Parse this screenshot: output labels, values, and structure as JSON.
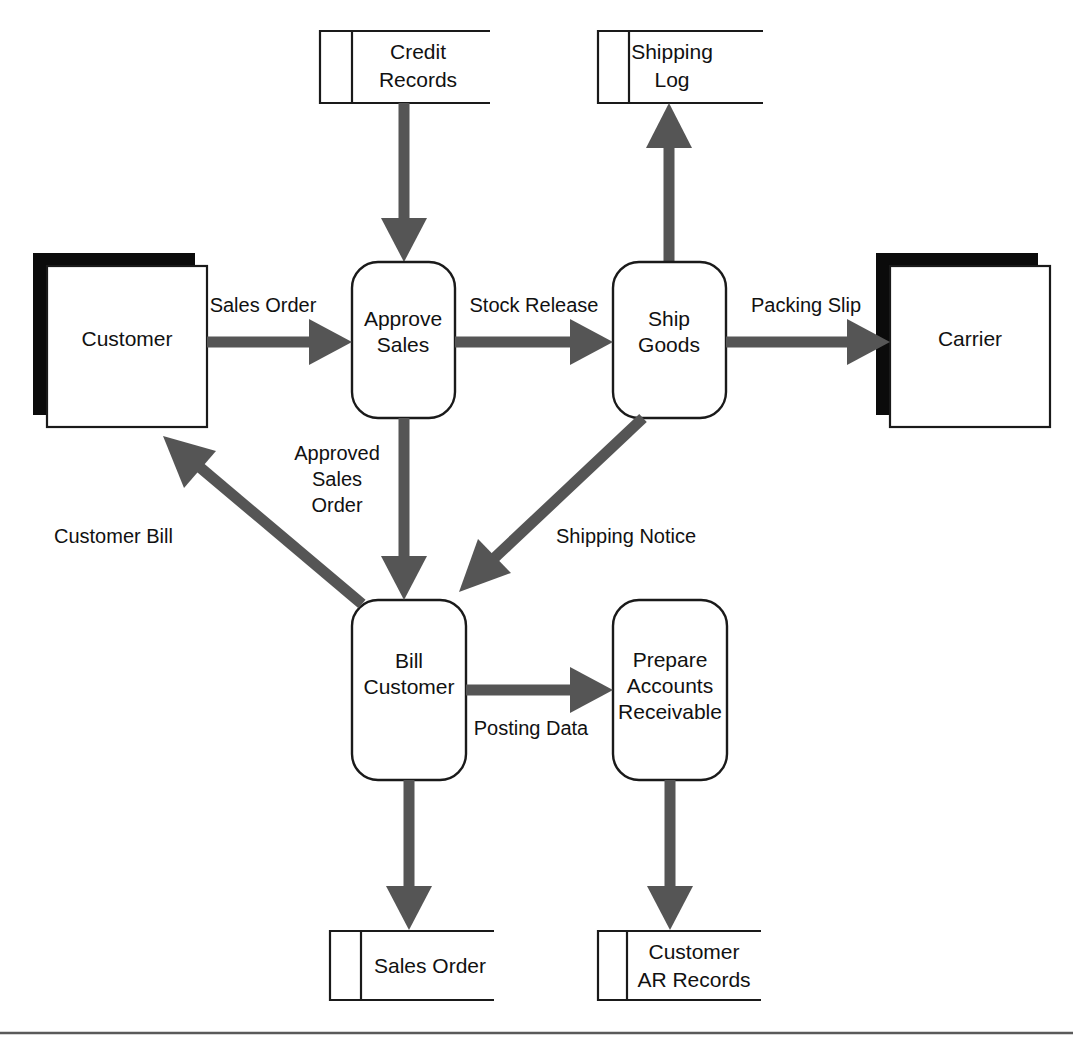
{
  "diagram": {
    "type": "data-flow-diagram",
    "colors": {
      "flow_arrow": "#555555",
      "shape_outline": "#1a1a1a",
      "entity_shadow": "#0b0b0b",
      "background": "#ffffff",
      "rule": "#5a5a5a"
    },
    "external_entities": [
      {
        "id": "customer",
        "label": "Customer"
      },
      {
        "id": "carrier",
        "label": "Carrier"
      }
    ],
    "processes": [
      {
        "id": "approve-sales",
        "label_lines": [
          "Approve",
          "Sales"
        ]
      },
      {
        "id": "ship-goods",
        "label_lines": [
          "Ship",
          "Goods"
        ]
      },
      {
        "id": "bill-customer",
        "label_lines": [
          "Bill",
          "Customer"
        ]
      },
      {
        "id": "prepare-accounts-receivable",
        "label_lines": [
          "Prepare",
          "Accounts",
          "Receivable"
        ]
      }
    ],
    "data_stores": [
      {
        "id": "credit-records",
        "label_lines": [
          "Credit",
          "Records"
        ]
      },
      {
        "id": "shipping-log",
        "label_lines": [
          "Shipping",
          "Log"
        ]
      },
      {
        "id": "sales-order-store",
        "label_lines": [
          "Sales Order"
        ]
      },
      {
        "id": "customer-ar-records",
        "label_lines": [
          "Customer",
          "AR Records"
        ]
      }
    ],
    "data_flows": [
      {
        "id": "sales-order",
        "label_lines": [
          "Sales Order"
        ],
        "from": "customer",
        "to": "approve-sales"
      },
      {
        "id": "credit-check",
        "label_lines": [],
        "from": "credit-records",
        "to": "approve-sales"
      },
      {
        "id": "stock-release",
        "label_lines": [
          "Stock Release"
        ],
        "from": "approve-sales",
        "to": "ship-goods"
      },
      {
        "id": "packing-slip",
        "label_lines": [
          "Packing Slip"
        ],
        "from": "ship-goods",
        "to": "carrier"
      },
      {
        "id": "shipping-log-entry",
        "label_lines": [],
        "from": "ship-goods",
        "to": "shipping-log"
      },
      {
        "id": "approved-sales-order",
        "label_lines": [
          "Approved",
          "Sales",
          "Order"
        ],
        "from": "approve-sales",
        "to": "bill-customer"
      },
      {
        "id": "shipping-notice",
        "label_lines": [
          "Shipping Notice"
        ],
        "from": "ship-goods",
        "to": "bill-customer"
      },
      {
        "id": "customer-bill",
        "label_lines": [
          "Customer Bill"
        ],
        "from": "bill-customer",
        "to": "customer"
      },
      {
        "id": "posting-data",
        "label_lines": [
          "Posting Data"
        ],
        "from": "bill-customer",
        "to": "prepare-accounts-receivable"
      },
      {
        "id": "sales-order-record",
        "label_lines": [],
        "from": "bill-customer",
        "to": "sales-order-store"
      },
      {
        "id": "ar-record",
        "label_lines": [],
        "from": "prepare-accounts-receivable",
        "to": "customer-ar-records"
      }
    ]
  }
}
